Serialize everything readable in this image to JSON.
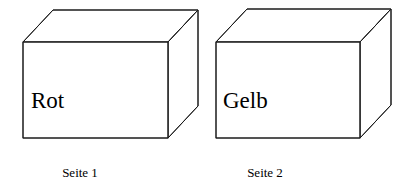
{
  "figure": {
    "background_color": "#ffffff",
    "line_color": "#1a1a1a",
    "text_color": "#000000",
    "boxes": [
      {
        "id": "box-1",
        "face_label": "Rot",
        "caption": "Seite 1",
        "front": {
          "x": 23,
          "y": 42,
          "width": 145,
          "height": 96
        },
        "depth": {
          "dx": 30,
          "dy": -32
        },
        "face_label_pos": {
          "x": 31,
          "y": 108
        },
        "caption_pos": {
          "x": 80,
          "y": 177
        }
      },
      {
        "id": "box-2",
        "face_label": "Gelb",
        "caption": "Seite 2",
        "front": {
          "x": 216,
          "y": 42,
          "width": 144,
          "height": 96
        },
        "depth": {
          "dx": 31,
          "dy": -33
        },
        "face_label_pos": {
          "x": 223,
          "y": 108
        },
        "caption_pos": {
          "x": 265,
          "y": 177
        }
      }
    ]
  }
}
